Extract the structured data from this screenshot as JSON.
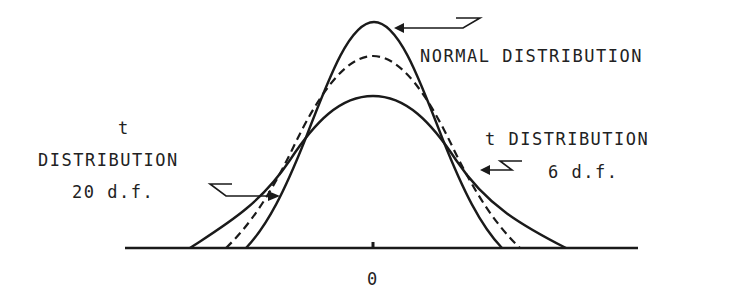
{
  "diagram": {
    "title": "",
    "axis": {
      "tick_label": "0"
    },
    "labels": {
      "normal": "NORMAL DISTRIBUTION",
      "t20_line1": "t",
      "t20_line2": "DISTRIBUTION",
      "t20_line3": "20 d.f.",
      "t6_line1": "t DISTRIBUTION",
      "t6_line2": "6 d.f."
    },
    "curves": [
      {
        "name": "Normal distribution",
        "style": "solid",
        "peak": "tallest, narrowest"
      },
      {
        "name": "t distribution 20 d.f.",
        "style": "dashed",
        "peak": "intermediate"
      },
      {
        "name": "t distribution 6 d.f.",
        "style": "solid",
        "peak": "lowest, widest tails"
      }
    ],
    "colors": {
      "ink": "#1a1a1a",
      "background": "#ffffff"
    }
  }
}
